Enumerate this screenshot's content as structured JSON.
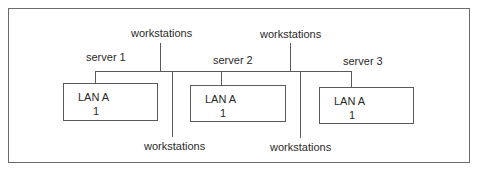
{
  "diagram": {
    "type": "network-bus",
    "top_labels": [
      {
        "text": "workstations"
      },
      {
        "text": "workstations"
      }
    ],
    "bottom_labels": [
      {
        "text": "workstations"
      },
      {
        "text": "workstations"
      }
    ],
    "servers": [
      {
        "label": "server 1",
        "box_title": "LAN A",
        "box_number": "1"
      },
      {
        "label": "server 2",
        "box_title": "LAN A",
        "box_number": "1"
      },
      {
        "label": "server 3",
        "box_title": "LAN A",
        "box_number": "1"
      }
    ],
    "colors": {
      "line": "#5a5a5a",
      "frame": "#6a6a6a",
      "text": "#2a2a2a"
    }
  }
}
